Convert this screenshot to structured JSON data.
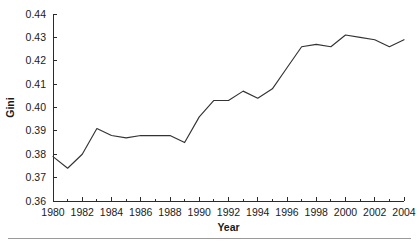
{
  "chart_data": {
    "type": "line",
    "title": "",
    "xlabel": "Year",
    "ylabel": "Gini",
    "x": [
      1980,
      1981,
      1982,
      1983,
      1984,
      1985,
      1986,
      1987,
      1988,
      1989,
      1990,
      1991,
      1992,
      1993,
      1994,
      1995,
      1996,
      1997,
      1998,
      1999,
      2000,
      2001,
      2002,
      2003,
      2004
    ],
    "values": [
      0.379,
      0.374,
      0.38,
      0.391,
      0.388,
      0.387,
      0.388,
      0.388,
      0.388,
      0.385,
      0.396,
      0.403,
      0.403,
      0.407,
      0.404,
      0.408,
      0.417,
      0.426,
      0.427,
      0.426,
      0.431,
      0.43,
      0.429,
      0.426,
      0.429
    ],
    "series": [
      {
        "name": "Gini",
        "values": [
          0.379,
          0.374,
          0.38,
          0.391,
          0.388,
          0.387,
          0.388,
          0.388,
          0.388,
          0.385,
          0.396,
          0.403,
          0.403,
          0.407,
          0.404,
          0.408,
          0.417,
          0.426,
          0.427,
          0.426,
          0.431,
          0.43,
          0.429,
          0.426,
          0.429
        ]
      }
    ],
    "xlim": [
      1980,
      2004
    ],
    "ylim": [
      0.36,
      0.44
    ],
    "x_tick_labels": [
      "1980",
      "1982",
      "1984",
      "1986",
      "1988",
      "1990",
      "1992",
      "1994",
      "1996",
      "1998",
      "2000",
      "2002",
      "2004"
    ],
    "x_tick_values": [
      1980,
      1982,
      1984,
      1986,
      1988,
      1990,
      1992,
      1994,
      1996,
      1998,
      2000,
      2002,
      2004
    ],
    "x_minor_tick_values": [
      1981,
      1983,
      1985,
      1987,
      1989,
      1991,
      1993,
      1995,
      1997,
      1999,
      2001,
      2003
    ],
    "y_tick_labels": [
      "0.36",
      "0.37",
      "0.38",
      "0.39",
      "0.40",
      "0.41",
      "0.42",
      "0.43",
      "0.44"
    ],
    "y_tick_values": [
      0.36,
      0.37,
      0.38,
      0.39,
      0.4,
      0.41,
      0.42,
      0.43,
      0.44
    ],
    "grid": false,
    "legend": false,
    "legend_position": "none",
    "line_color": "#333333",
    "axis_color": "#2b2b2b",
    "background_color": "#ffffff"
  }
}
